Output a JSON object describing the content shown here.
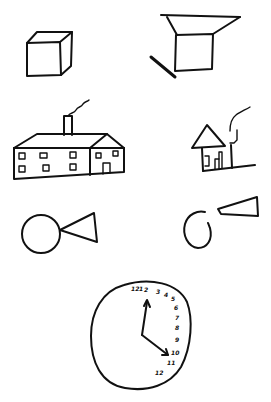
{
  "sheet": {
    "background": "#ffffff",
    "ink_color": "#111111",
    "rows": [
      {
        "left": "model-cube",
        "right": "copied-cube"
      },
      {
        "left": "model-house",
        "right": "copied-house"
      },
      {
        "left": "model-circle-triangle",
        "right": "copied-circle-triangle"
      }
    ],
    "bottom": "clock-drawing"
  },
  "clock": {
    "numbers": [
      "12",
      "1",
      "2",
      "3",
      "4",
      "5",
      "6",
      "7",
      "8",
      "9",
      "10",
      "11",
      "12"
    ],
    "hands": {
      "hour_direction": "12",
      "minute_direction": "4"
    }
  }
}
